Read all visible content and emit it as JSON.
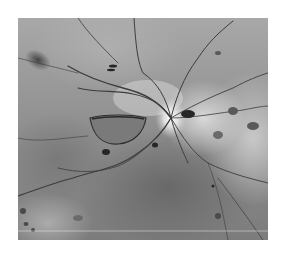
{
  "image": {
    "type": "grayscale fundus photograph",
    "features": {
      "optic_disc": "bright radiating disc with vessels",
      "hemorrhage": "oval pre-retinal hemorrhage left of disc",
      "spots": "scattered dark blot hemorrhages"
    }
  }
}
